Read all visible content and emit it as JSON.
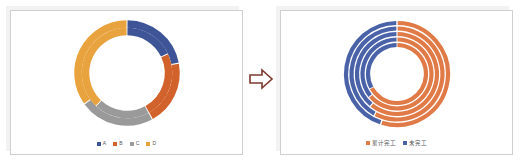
{
  "colors": {
    "amber": "#E8A33E",
    "blue": "#3D5597",
    "orange": "#D2622B",
    "gray": "#9A9A9A",
    "right_orange": "#E07A47",
    "right_blue": "#4A63A8",
    "arrow": "#7B3A2E",
    "question": "#E05A4A",
    "panel_border": "#CFCFCF",
    "panel_shadow": "#F2F2F2",
    "background": "#FFFFFF"
  },
  "arrow": {
    "icon": "right-arrow-icon",
    "label": "transforms into"
  },
  "question_mark": {
    "glyph": "?",
    "label": "?"
  },
  "left_panel": {
    "name": "before-chart-slide",
    "legend": [
      {
        "label": "A",
        "color": "#3D5597"
      },
      {
        "label": "B",
        "color": "#D2622B"
      },
      {
        "label": "C",
        "color": "#9A9A9A"
      },
      {
        "label": "D",
        "color": "#E8A33E"
      }
    ]
  },
  "right_panel": {
    "name": "after-chart-slide",
    "legend": [
      {
        "label": "累计完工",
        "color": "#E07A47"
      },
      {
        "label": "未完工",
        "color": "#4A63A8"
      }
    ]
  },
  "chart_data": [
    {
      "type": "pie",
      "name": "left-multi-ring-donut",
      "title": "",
      "subtype": "multi-ring-doughnut",
      "legend_position": "bottom",
      "categories": [
        "A",
        "B",
        "C",
        "D"
      ],
      "colors": [
        "#3D5597",
        "#D2622B",
        "#9A9A9A",
        "#E8A33E"
      ],
      "rings": [
        {
          "ring": "outer",
          "values": [
            22,
            20,
            23,
            35
          ],
          "start_angle": 0
        },
        {
          "ring": "inner",
          "values": [
            18,
            24,
            20,
            38
          ],
          "start_angle": 0
        }
      ]
    },
    {
      "type": "pie",
      "name": "right-multi-ring-donut",
      "title": "",
      "subtype": "multi-ring-doughnut",
      "legend_position": "bottom",
      "categories": [
        "累计完工",
        "未完工"
      ],
      "colors": [
        "#E07A47",
        "#4A63A8"
      ],
      "rings": [
        {
          "ring": "ring-1",
          "values": [
            55,
            45
          ],
          "start_angle": 0
        },
        {
          "ring": "ring-2",
          "values": [
            58,
            42
          ],
          "start_angle": 0
        },
        {
          "ring": "ring-3",
          "values": [
            61,
            39
          ],
          "start_angle": 0
        },
        {
          "ring": "ring-4",
          "values": [
            64,
            36
          ],
          "start_angle": 0
        },
        {
          "ring": "ring-5",
          "values": [
            67,
            33
          ],
          "start_angle": 0
        }
      ]
    }
  ]
}
